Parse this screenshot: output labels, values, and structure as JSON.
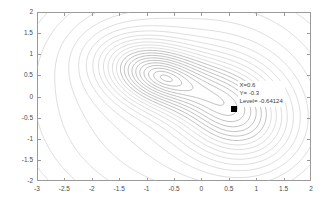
{
  "figure": {
    "background_color": "#ffffff",
    "axis_color": "#9a9a9a",
    "contour_color": "#b4b4b4",
    "contour_color_dark": "#8c8c8c",
    "tick_label_color": "#4a4a4a"
  },
  "datatip": {
    "x_label": "X=0.6",
    "y_label": "Y= -0.3",
    "level_label": "Level= -0.64124",
    "marker_x": 0.6,
    "marker_y": -0.3,
    "marker_color": "#000000"
  },
  "chart_data": {
    "type": "line",
    "plot_kind": "contour",
    "title": "",
    "xlabel": "",
    "ylabel": "",
    "xlim": [
      -3,
      2
    ],
    "ylim": [
      -2,
      2
    ],
    "grid": false,
    "legend": "none",
    "xticks": [
      -3,
      -2.5,
      -2,
      -1.5,
      -1,
      -0.5,
      0,
      0.5,
      1,
      1.5,
      2
    ],
    "xticklabels": [
      "-3",
      "-2.5",
      "-2",
      "-1.5",
      "-1",
      "-0.5",
      "0",
      "0.5",
      "1",
      "1.5",
      "2"
    ],
    "yticks": [
      -2,
      -1.5,
      -1,
      -0.5,
      0,
      0.5,
      1,
      1.5,
      2
    ],
    "yticklabels": [
      "-2",
      "-1.5",
      "-1",
      "-0.5",
      "0",
      "0.5",
      "1",
      "1.5",
      "2"
    ],
    "minima": [
      {
        "name": "left-basin-center",
        "x": -0.9,
        "y": 0.55
      },
      {
        "name": "right-basin-center",
        "x": 0.6,
        "y": -0.35
      }
    ],
    "selected_point": {
      "x": 0.6,
      "y": -0.3,
      "level": -0.64124
    },
    "n_contour_levels": 22,
    "annotations": [
      {
        "text": "X=0.6",
        "x": 0.72,
        "y": 0.27
      },
      {
        "text": "Y= -0.3",
        "x": 0.72,
        "y": 0.12
      },
      {
        "text": "Level= -0.64124",
        "x": 0.72,
        "y": -0.03
      }
    ]
  }
}
